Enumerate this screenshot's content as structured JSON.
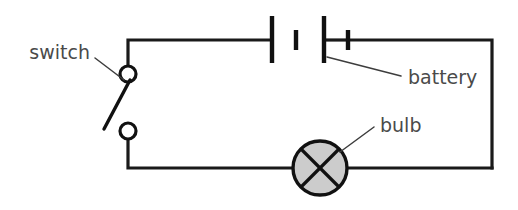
{
  "diagram": {
    "background_color": "#ffffff",
    "wire_color": "#1a1a1a",
    "label_color": "#4a4a4a",
    "bulb_fill_color": "#cccccc",
    "components": [
      {
        "name": "switch",
        "label": "switch",
        "state": "open",
        "terminals": 2
      },
      {
        "name": "battery",
        "label": "battery",
        "cells": 2,
        "plates": 4
      },
      {
        "name": "bulb",
        "label": "bulb",
        "symbol": "circle-with-cross"
      }
    ],
    "labels": {
      "switch": "switch",
      "battery": "battery",
      "bulb": "bulb"
    }
  }
}
